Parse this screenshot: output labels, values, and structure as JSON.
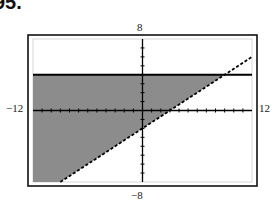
{
  "problem_number": "95.",
  "chart_data": {
    "type": "area",
    "title": "",
    "xlabel": "",
    "ylabel": "",
    "xlim": [
      -12,
      12
    ],
    "ylim": [
      -8,
      8
    ],
    "tick_labels": {
      "x_min": "−12",
      "x_max": "12",
      "y_min": "−8",
      "y_max": "8"
    },
    "grid": false,
    "tick_interval": 1,
    "boundaries": [
      {
        "name": "horizontal boundary",
        "equation": "y = 4",
        "style": "solid"
      },
      {
        "name": "slanted boundary",
        "equation": "y = (2/3)x - 2",
        "style": "dashed"
      }
    ],
    "shaded_region": "y <= 4 and y > (2/3)x - 2",
    "shade_color": "#8c8c8c",
    "line_color": "#000000"
  }
}
